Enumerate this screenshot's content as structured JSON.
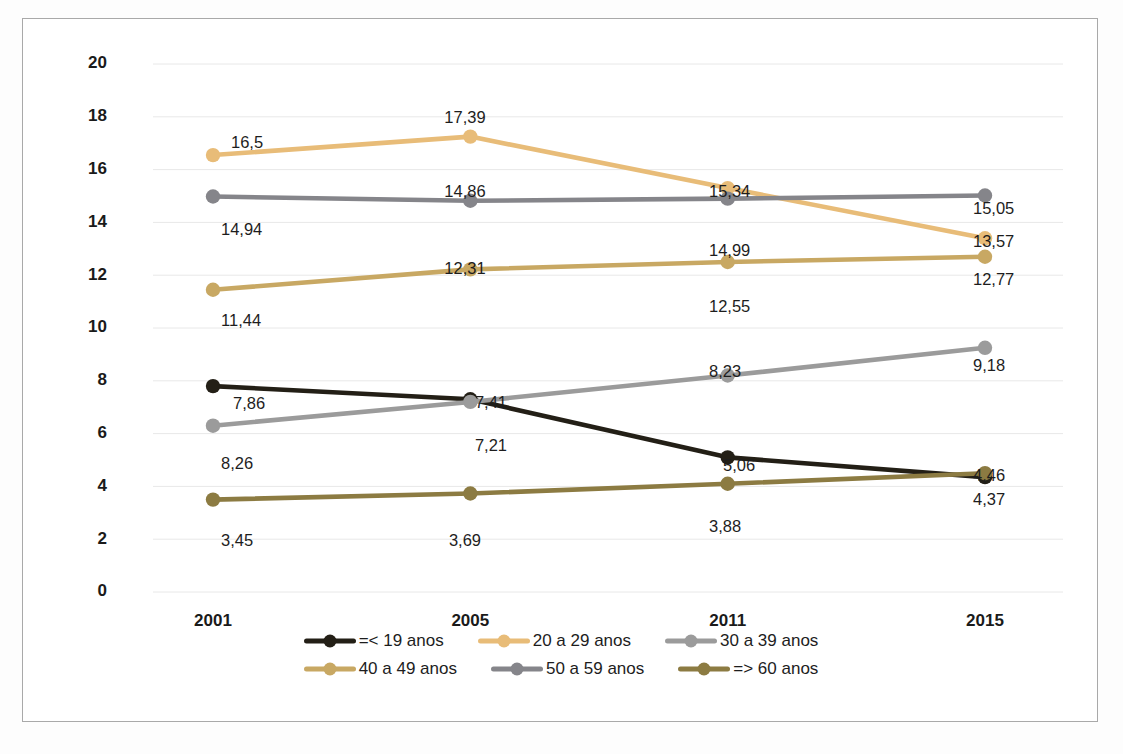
{
  "chart_data": {
    "type": "line",
    "title": "",
    "subtitle": "",
    "xlabel": "",
    "ylabel": "",
    "categories": [
      "2001",
      "2005",
      "2011",
      "2015"
    ],
    "ylim": [
      0,
      20
    ],
    "ytick_step": 2,
    "ytick_labels": [
      "0",
      "2",
      "4",
      "6",
      "8",
      "10",
      "12",
      "14",
      "16",
      "18",
      "20"
    ],
    "grid": true,
    "legend_position": "bottom",
    "decimal_separator": ",",
    "series": [
      {
        "name": "=< 19 anos",
        "color": "#231f16",
        "values": [
          7.86,
          7.41,
          5.06,
          4.37
        ],
        "plotted": [
          7.8,
          7.3,
          5.1,
          4.35
        ],
        "labels": [
          "7,86",
          "7,41",
          "5,06",
          "4,37"
        ]
      },
      {
        "name": "20 a 29 anos",
        "color": "#e8bc78",
        "values": [
          16.5,
          17.39,
          15.34,
          13.57
        ],
        "plotted": [
          16.55,
          17.25,
          15.3,
          13.4
        ],
        "labels": [
          "16,5",
          "17,39",
          "15,34",
          "13,57"
        ]
      },
      {
        "name": "30 a 39 anos",
        "color": "#9b9b9b",
        "values": [
          8.26,
          7.21,
          8.23,
          9.18
        ],
        "plotted": [
          6.3,
          7.2,
          8.2,
          9.25
        ],
        "labels": [
          "8,26",
          "7,21",
          "8,23",
          "9,18"
        ]
      },
      {
        "name": "40 a 49 anos",
        "color": "#c8a863",
        "values": [
          11.44,
          12.31,
          12.55,
          12.77
        ],
        "plotted": [
          11.45,
          12.22,
          12.5,
          12.7
        ],
        "labels": [
          "11,44",
          "12,31",
          "12,55",
          "12,77"
        ]
      },
      {
        "name": "50 a 59 anos",
        "color": "#85858a",
        "values": [
          14.94,
          14.86,
          14.99,
          15.05
        ],
        "plotted": [
          14.98,
          14.82,
          14.9,
          15.02
        ],
        "labels": [
          "14,94",
          "14,86",
          "14,99",
          "15,05"
        ]
      },
      {
        "name": "=> 60 anos",
        "color": "#8c7b42",
        "values": [
          3.45,
          3.69,
          3.88,
          4.46
        ],
        "plotted": [
          3.5,
          3.73,
          4.1,
          4.5
        ],
        "labels": [
          "3,45",
          "3,69",
          "3,88",
          "4,46"
        ]
      }
    ],
    "point_labels": [
      {
        "text": "16,5",
        "x": 208,
        "y": 129,
        "anchor": "start",
        "series": "20 a 29 anos",
        "point": "2001"
      },
      {
        "text": "17,39",
        "x": 442,
        "y": 104,
        "anchor": "middle",
        "series": "20 a 29 anos",
        "point": "2005"
      },
      {
        "text": "15,34",
        "x": 686,
        "y": 178,
        "anchor": "start",
        "series": "20 a 29 anos",
        "point": "2011"
      },
      {
        "text": "13,57",
        "x": 950,
        "y": 228,
        "anchor": "start",
        "series": "20 a 29 anos",
        "point": "2015"
      },
      {
        "text": "14,94",
        "x": 198,
        "y": 216,
        "anchor": "start",
        "series": "50 a 59 anos",
        "point": "2001"
      },
      {
        "text": "14,86",
        "x": 442,
        "y": 178,
        "anchor": "middle",
        "series": "50 a 59 anos",
        "point": "2005"
      },
      {
        "text": "14,99",
        "x": 686,
        "y": 237,
        "anchor": "start",
        "series": "50 a 59 anos",
        "point": "2011"
      },
      {
        "text": "15,05",
        "x": 950,
        "y": 195,
        "anchor": "start",
        "series": "50 a 59 anos",
        "point": "2015"
      },
      {
        "text": "11,44",
        "x": 198,
        "y": 307,
        "anchor": "start",
        "series": "40 a 49 anos",
        "point": "2001"
      },
      {
        "text": "12,31",
        "x": 442,
        "y": 255,
        "anchor": "middle",
        "series": "40 a 49 anos",
        "point": "2005"
      },
      {
        "text": "12,55",
        "x": 686,
        "y": 293,
        "anchor": "start",
        "series": "40 a 49 anos",
        "point": "2011"
      },
      {
        "text": "12,77",
        "x": 950,
        "y": 266,
        "anchor": "start",
        "series": "40 a 49 anos",
        "point": "2015"
      },
      {
        "text": "7,86",
        "x": 210,
        "y": 390,
        "anchor": "start",
        "series": "=< 19 anos",
        "point": "2001"
      },
      {
        "text": "7,41",
        "x": 468,
        "y": 389,
        "anchor": "middle",
        "series": "=< 19 anos",
        "point": "2005"
      },
      {
        "text": "5,06",
        "x": 700,
        "y": 452,
        "anchor": "start",
        "series": "=< 19 anos",
        "point": "2011"
      },
      {
        "text": "4,37",
        "x": 950,
        "y": 486,
        "anchor": "start",
        "series": "=< 19 anos",
        "point": "2015"
      },
      {
        "text": "8,26",
        "x": 198,
        "y": 450,
        "anchor": "start",
        "series": "30 a 39 anos",
        "point": "2001"
      },
      {
        "text": "7,21",
        "x": 468,
        "y": 432,
        "anchor": "middle",
        "series": "30 a 39 anos",
        "point": "2005"
      },
      {
        "text": "8,23",
        "x": 686,
        "y": 358,
        "anchor": "start",
        "series": "30 a 39 anos",
        "point": "2011"
      },
      {
        "text": "9,18",
        "x": 950,
        "y": 352,
        "anchor": "start",
        "series": "30 a 39 anos",
        "point": "2015"
      },
      {
        "text": "3,45",
        "x": 198,
        "y": 527,
        "anchor": "start",
        "series": "=> 60 anos",
        "point": "2001"
      },
      {
        "text": "3,69",
        "x": 442,
        "y": 527,
        "anchor": "middle",
        "series": "=> 60 anos",
        "point": "2005"
      },
      {
        "text": "3,88",
        "x": 686,
        "y": 513,
        "anchor": "start",
        "series": "=> 60 anos",
        "point": "2011"
      },
      {
        "text": "4,46",
        "x": 950,
        "y": 462,
        "anchor": "start",
        "series": "=> 60 anos",
        "point": "2015"
      }
    ]
  },
  "legend": {
    "rows": [
      [
        {
          "label": "=< 19 anos",
          "color": "#231f16"
        },
        {
          "label": "20 a 29 anos",
          "color": "#e8bc78"
        },
        {
          "label": "30 a 39 anos",
          "color": "#9b9b9b"
        }
      ],
      [
        {
          "label": "40 a 49 anos",
          "color": "#c8a863"
        },
        {
          "label": "50 a 59 anos",
          "color": "#85858a"
        },
        {
          "label": "=> 60 anos",
          "color": "#8c7b42"
        }
      ]
    ]
  }
}
